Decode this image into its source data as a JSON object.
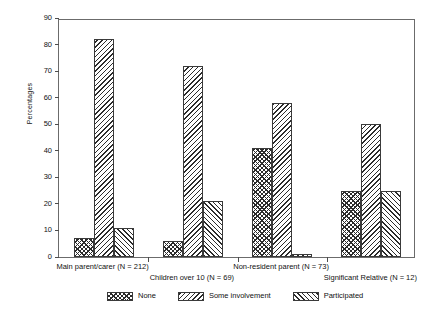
{
  "chart_data": {
    "type": "bar",
    "title": "",
    "xlabel": "",
    "ylabel": "Percentages",
    "ylim": [
      0,
      90
    ],
    "ytick_step": 10,
    "yticks": [
      0,
      10,
      20,
      30,
      40,
      50,
      60,
      70,
      80,
      90
    ],
    "grid": false,
    "legend_position": "bottom",
    "categories": [
      "Main parent/carer (N = 212)",
      "Children over 10 (N = 69)",
      "Non-resident parent (N = 73)",
      "Significant Relative (N = 12)"
    ],
    "series": [
      {
        "name": "None",
        "pattern": "cross-hatch",
        "values": [
          7,
          6,
          41,
          25
        ]
      },
      {
        "name": "Some involvement",
        "pattern": "backslash-hatch",
        "values": [
          82,
          72,
          58,
          50
        ]
      },
      {
        "name": "Participated",
        "pattern": "forwardslash-hatch",
        "values": [
          11,
          21,
          1,
          25
        ]
      }
    ]
  },
  "axis": {
    "y_title": "Percentages",
    "y_tick_labels": [
      "0",
      "10",
      "20",
      "30",
      "40",
      "50",
      "60",
      "70",
      "80",
      "90"
    ]
  },
  "legend": {
    "items": [
      {
        "label": "None"
      },
      {
        "label": "Some involvement"
      },
      {
        "label": "Participated"
      }
    ]
  },
  "groups": [
    {
      "label": "Main parent/carer (N = 212)"
    },
    {
      "label": "Children over 10 (N = 69)"
    },
    {
      "label": "Non-resident parent (N = 73)"
    },
    {
      "label": "Significant Relative (N = 12)"
    }
  ],
  "colors": {
    "frame": "#6b6b6b",
    "hatch": "#2b2b2b",
    "bar_edge": "#3a3a3a",
    "background": "#ffffff",
    "text": "#111111"
  }
}
